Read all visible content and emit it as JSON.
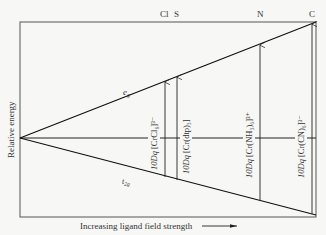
{
  "diagram": {
    "y_axis_label": "Relative energy",
    "x_axis_label": "Increasing ligand field strength",
    "upper_level_label": "e_g",
    "lower_level_label": "t_2g",
    "donor_atoms": [
      {
        "label": "Cl",
        "x": 165
      },
      {
        "label": "S",
        "x": 177
      },
      {
        "label": "N",
        "x": 260
      },
      {
        "label": "C",
        "x": 312
      }
    ],
    "splittings": [
      {
        "label": "10Dq [CrCl6]3-",
        "prefix": "10Dq",
        "complex": "[CrCl₆]³⁻",
        "x": 165
      },
      {
        "label": "10Dq [Cr(dtp)3]",
        "prefix": "10Dq",
        "complex": "[Cr(dtp)₃]",
        "x": 177
      },
      {
        "label": "10Dq [Cr(NH3)6]3+",
        "prefix": "10Dq",
        "complex": "[Cr(NH₃)₆]³⁺",
        "x": 260
      },
      {
        "label": "10Dq [Cr(CN)6]3-",
        "prefix": "10Dq",
        "complex": "[Cr(CN)₆]³⁻",
        "x": 312
      }
    ]
  }
}
